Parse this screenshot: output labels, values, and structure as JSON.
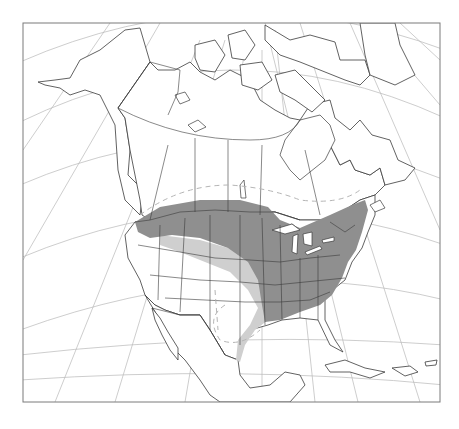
{
  "map": {
    "region": "North America",
    "projection": "conic (graticule shown)",
    "colors": {
      "range_core": "#8f8f8f",
      "range_secondary": "#cfcfcf",
      "extent_line": "#b5b5b5",
      "land_outline": "#3a3a3a",
      "graticule": "#b8b8b8"
    },
    "legend_layers": [
      {
        "id": "core",
        "label": "Core range (dark gray)"
      },
      {
        "id": "secondary",
        "label": "Secondary range (light gray)"
      },
      {
        "id": "extent",
        "label": "Extent limit (dashed line)"
      }
    ]
  },
  "caption": ""
}
